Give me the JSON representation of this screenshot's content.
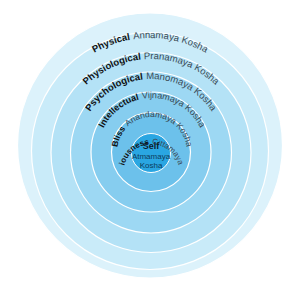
{
  "diagram": {
    "type": "concentric-layers",
    "center_label": {
      "title": "Self",
      "line1": "Atmamaya",
      "line2": "Kosha"
    },
    "layers": [
      {
        "name": "Physical",
        "sanskrit": "Annamaya Kosha",
        "color": "#dcf2fb"
      },
      {
        "name": "Physiological",
        "sanskrit": "Pranamaya Kosha",
        "color": "#c9ebf9"
      },
      {
        "name": "Psychological",
        "sanskrit": "Manomaya Kosha",
        "color": "#b4e2f6"
      },
      {
        "name": "Intellectual",
        "sanskrit": "Vijnamaya Kosha",
        "color": "#9dd8f3"
      },
      {
        "name": "Bliss",
        "sanskrit": "Anandamaya Kosha",
        "color": "#86cdef"
      },
      {
        "name": "Consciousness",
        "sanskrit": "Cittamaya Kosha",
        "color": "#6cc1eb"
      }
    ],
    "core_color": "#2aa6e2",
    "ring_border_color": "#ffffff"
  }
}
